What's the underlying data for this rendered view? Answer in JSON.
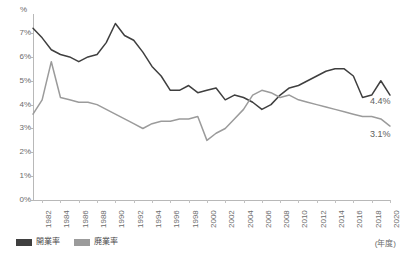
{
  "chart_data": {
    "type": "line",
    "title": "",
    "xlabel": "(年度)",
    "ylabel": "%",
    "ylim": [
      0,
      7.8
    ],
    "yticks": [
      "0%",
      "1%",
      "2%",
      "3%",
      "4%",
      "5%",
      "6%",
      "7%"
    ],
    "ytick_values": [
      0,
      1,
      2,
      3,
      4,
      5,
      6,
      7
    ],
    "grid": false,
    "legend_position": "bottom-left",
    "x": [
      1981,
      1982,
      1983,
      1984,
      1985,
      1986,
      1987,
      1988,
      1989,
      1990,
      1991,
      1992,
      1993,
      1994,
      1995,
      1996,
      1997,
      1998,
      1999,
      2000,
      2001,
      2002,
      2003,
      2004,
      2005,
      2006,
      2007,
      2008,
      2009,
      2010,
      2011,
      2012,
      2013,
      2014,
      2015,
      2016,
      2017,
      2018,
      2019,
      2020
    ],
    "xtick_labels": [
      "1982",
      "1984",
      "1986",
      "1988",
      "1990",
      "1992",
      "1994",
      "1996",
      "1998",
      "2000",
      "2002",
      "2004",
      "2006",
      "2008",
      "2010",
      "2012",
      "2014",
      "2016",
      "2018",
      "2020"
    ],
    "series": [
      {
        "name": "開業率",
        "color": "#3f3f3f",
        "end_label": "4.4%",
        "values": [
          7.2,
          6.8,
          6.3,
          6.1,
          6.0,
          5.8,
          6.0,
          6.1,
          6.6,
          7.4,
          6.9,
          6.7,
          6.2,
          5.6,
          5.2,
          4.6,
          4.6,
          4.8,
          4.5,
          4.6,
          4.7,
          4.2,
          4.4,
          4.3,
          4.1,
          3.8,
          4.0,
          4.4,
          4.7,
          4.8,
          5.0,
          5.2,
          5.4,
          5.5,
          5.5,
          5.2,
          4.3,
          4.4,
          5.0,
          4.4
        ]
      },
      {
        "name": "廃業率",
        "color": "#9b9b9b",
        "end_label": "3.1%",
        "values": [
          3.6,
          4.2,
          5.8,
          4.3,
          4.2,
          4.1,
          4.1,
          4.0,
          3.8,
          3.6,
          3.4,
          3.2,
          3.0,
          3.2,
          3.3,
          3.3,
          3.4,
          3.4,
          3.5,
          2.5,
          2.8,
          3.0,
          3.4,
          3.8,
          4.4,
          4.6,
          4.5,
          4.3,
          4.4,
          4.2,
          4.1,
          4.0,
          3.9,
          3.8,
          3.7,
          3.6,
          3.5,
          3.5,
          3.4,
          3.1
        ]
      }
    ]
  },
  "legend": {
    "items": [
      {
        "label": "開業率",
        "color": "#3f3f3f"
      },
      {
        "label": "廃業率",
        "color": "#9b9b9b"
      }
    ]
  },
  "axis": {
    "unit_top": "%",
    "unit_right": "(年度)"
  },
  "endpoints": {
    "open_rate": "4.4%",
    "close_rate": "3.1%"
  }
}
